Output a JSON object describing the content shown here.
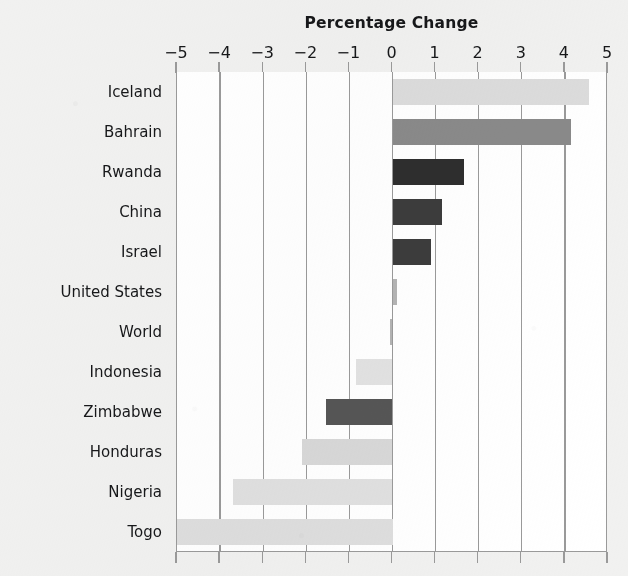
{
  "chart_data": {
    "type": "bar",
    "orientation": "horizontal",
    "title": "Percentage Change",
    "xlabel": "",
    "ylabel": "",
    "xlim": [
      -5,
      5
    ],
    "xticks": [
      -5,
      -4,
      -3,
      -2,
      -1,
      0,
      1,
      2,
      3,
      4,
      5
    ],
    "xtick_labels": [
      "−5",
      "−4",
      "−3",
      "−2",
      "−1",
      "0",
      "1",
      "2",
      "3",
      "4",
      "5"
    ],
    "grid": true,
    "grid_axis": "x",
    "legend": false,
    "categories": [
      "Iceland",
      "Bahrain",
      "Rwanda",
      "China",
      "Israel",
      "United States",
      "World",
      "Indonesia",
      "Zimbabwe",
      "Honduras",
      "Nigeria",
      "Togo"
    ],
    "values": [
      4.55,
      4.15,
      1.65,
      1.15,
      0.9,
      0.1,
      -0.05,
      -0.85,
      -1.55,
      -2.1,
      -3.7,
      -5.2
    ],
    "bar_colors": [
      "#dcdcdc",
      "#8a8a8a",
      "#2e2e2e",
      "#3c3c3c",
      "#3c3c3c",
      "#b4b4b4",
      "#b4b4b4",
      "#e2e2e2",
      "#565656",
      "#d8d8d8",
      "#e0e0e0",
      "#dedede"
    ]
  },
  "style": {
    "background": "#f1f1f0",
    "plot_background": "#ffffff",
    "axis_color": "#9a9a9a",
    "text_color": "#17181a"
  }
}
